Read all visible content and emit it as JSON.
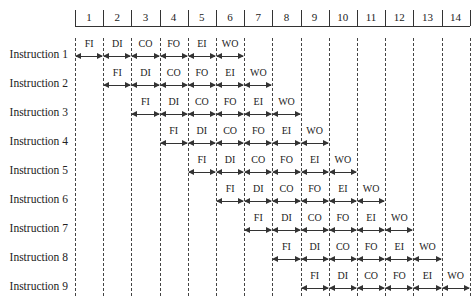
{
  "chart_data": {
    "type": "table",
    "time_slots": [
      1,
      2,
      3,
      4,
      5,
      6,
      7,
      8,
      9,
      10,
      11,
      12,
      13,
      14
    ],
    "stages": [
      "FI",
      "DI",
      "CO",
      "FO",
      "EI",
      "WO"
    ],
    "instructions": [
      {
        "label": "Instruction 1",
        "start": 1
      },
      {
        "label": "Instruction 2",
        "start": 2
      },
      {
        "label": "Instruction 3",
        "start": 3
      },
      {
        "label": "Instruction 4",
        "start": 4
      },
      {
        "label": "Instruction 5",
        "start": 5
      },
      {
        "label": "Instruction 6",
        "start": 6
      },
      {
        "label": "Instruction 7",
        "start": 7
      },
      {
        "label": "Instruction 8",
        "start": 8
      },
      {
        "label": "Instruction 9",
        "start": 9
      }
    ]
  },
  "ruler": {
    "labels": [
      "1",
      "2",
      "3",
      "4",
      "5",
      "6",
      "7",
      "8",
      "9",
      "10",
      "11",
      "12",
      "13",
      "14"
    ]
  },
  "rows": [
    {
      "label": "Instruction 1",
      "stages": [
        "FI",
        "DI",
        "CO",
        "FO",
        "EI",
        "WO"
      ]
    },
    {
      "label": "Instruction 2",
      "stages": [
        "FI",
        "DI",
        "CO",
        "FO",
        "EI",
        "WO"
      ]
    },
    {
      "label": "Instruction 3",
      "stages": [
        "FI",
        "DI",
        "CO",
        "FO",
        "EI",
        "WO"
      ]
    },
    {
      "label": "Instruction 4",
      "stages": [
        "FI",
        "DI",
        "CO",
        "FO",
        "EI",
        "WO"
      ]
    },
    {
      "label": "Instruction 5",
      "stages": [
        "FI",
        "DI",
        "CO",
        "FO",
        "EI",
        "WO"
      ]
    },
    {
      "label": "Instruction 6",
      "stages": [
        "FI",
        "DI",
        "CO",
        "FO",
        "EI",
        "WO"
      ]
    },
    {
      "label": "Instruction 7",
      "stages": [
        "FI",
        "DI",
        "CO",
        "FO",
        "EI",
        "WO"
      ]
    },
    {
      "label": "Instruction 8",
      "stages": [
        "FI",
        "DI",
        "CO",
        "FO",
        "EI",
        "WO"
      ]
    },
    {
      "label": "Instruction 9",
      "stages": [
        "FI",
        "DI",
        "CO",
        "FO",
        "EI",
        "WO"
      ]
    }
  ]
}
